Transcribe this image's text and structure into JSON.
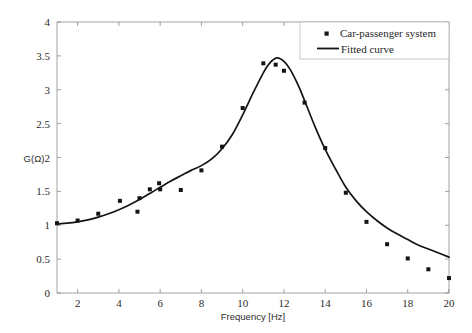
{
  "chart_data": {
    "type": "scatter",
    "title": "",
    "xlabel": "Frequency [Hz]",
    "ylabel": "G(Ω)",
    "xlim": [
      1,
      20
    ],
    "ylim": [
      0,
      4
    ],
    "xticks": [
      2,
      4,
      6,
      8,
      10,
      12,
      14,
      16,
      18,
      20
    ],
    "yticks": [
      0,
      0.5,
      1,
      1.5,
      2,
      2.5,
      3,
      3.5,
      4
    ],
    "xtick_labels": [
      "2",
      "4",
      "6",
      "8",
      "10",
      "12",
      "14",
      "16",
      "18",
      "20"
    ],
    "ytick_labels": [
      "0",
      "0.5",
      "1",
      "1.5",
      "2",
      "2.5",
      "3",
      "3.5",
      "4"
    ],
    "grid": false,
    "legend_position": "top-right",
    "series": [
      {
        "name": "Car-passenger system",
        "type": "scatter",
        "marker": "square",
        "color": "#141414",
        "points": [
          [
            1.0,
            1.03
          ],
          [
            2.0,
            1.07
          ],
          [
            3.0,
            1.17
          ],
          [
            4.05,
            1.36
          ],
          [
            4.9,
            1.2
          ],
          [
            5.0,
            1.4
          ],
          [
            5.5,
            1.53
          ],
          [
            5.95,
            1.62
          ],
          [
            6.0,
            1.53
          ],
          [
            7.0,
            1.52
          ],
          [
            8.0,
            1.81
          ],
          [
            9.0,
            2.16
          ],
          [
            10.0,
            2.73
          ],
          [
            11.0,
            3.39
          ],
          [
            11.6,
            3.37
          ],
          [
            12.0,
            3.28
          ],
          [
            13.0,
            2.81
          ],
          [
            14.0,
            2.14
          ],
          [
            15.0,
            1.48
          ],
          [
            16.0,
            1.05
          ],
          [
            17.0,
            0.72
          ],
          [
            18.0,
            0.51
          ],
          [
            19.0,
            0.35
          ],
          [
            20.0,
            0.22
          ]
        ]
      },
      {
        "name": "Fitted curve",
        "type": "line",
        "color": "#141414",
        "model": "resonance",
        "peak_frequency": 11.65,
        "peak_value": 3.47,
        "points": [
          [
            1.0,
            1.02
          ],
          [
            1.5,
            1.03
          ],
          [
            2.0,
            1.05
          ],
          [
            2.5,
            1.08
          ],
          [
            3.0,
            1.12
          ],
          [
            3.5,
            1.17
          ],
          [
            4.0,
            1.23
          ],
          [
            4.5,
            1.3
          ],
          [
            5.0,
            1.38
          ],
          [
            5.5,
            1.47
          ],
          [
            6.0,
            1.56
          ],
          [
            6.5,
            1.65
          ],
          [
            7.0,
            1.73
          ],
          [
            7.5,
            1.81
          ],
          [
            8.0,
            1.88
          ],
          [
            8.5,
            1.98
          ],
          [
            9.0,
            2.13
          ],
          [
            9.5,
            2.34
          ],
          [
            10.0,
            2.63
          ],
          [
            10.5,
            2.95
          ],
          [
            11.0,
            3.25
          ],
          [
            11.3,
            3.39
          ],
          [
            11.65,
            3.47
          ],
          [
            12.0,
            3.42
          ],
          [
            12.3,
            3.3
          ],
          [
            12.7,
            3.06
          ],
          [
            13.0,
            2.84
          ],
          [
            13.5,
            2.46
          ],
          [
            14.0,
            2.12
          ],
          [
            14.5,
            1.83
          ],
          [
            15.0,
            1.56
          ],
          [
            15.5,
            1.36
          ],
          [
            16.0,
            1.2
          ],
          [
            16.5,
            1.07
          ],
          [
            17.0,
            0.96
          ],
          [
            17.5,
            0.87
          ],
          [
            18.0,
            0.79
          ],
          [
            18.5,
            0.71
          ],
          [
            19.0,
            0.65
          ],
          [
            19.5,
            0.59
          ],
          [
            20.0,
            0.53
          ]
        ]
      }
    ],
    "legend": [
      {
        "label": "Car-passenger system",
        "marker": "square",
        "color": "#141414"
      },
      {
        "label": "Fitted curve",
        "marker": "line",
        "color": "#141414"
      }
    ]
  },
  "colors": {
    "curve": "#141414",
    "marker": "#141414",
    "axis": "#8a8a8a",
    "background": "#ffffff",
    "legend_border": "#b9b9b9"
  }
}
